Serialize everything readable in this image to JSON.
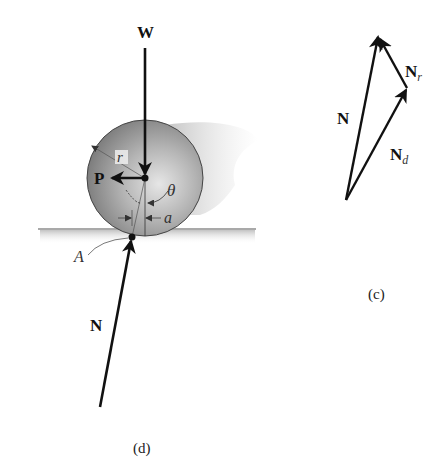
{
  "figure_d": {
    "caption": "(d)",
    "labels": {
      "weight": "W",
      "push_force": "P",
      "radius": "r",
      "angle": "θ",
      "offset": "a",
      "contact_point": "A",
      "normal": "N"
    },
    "colors": {
      "wheel_light": "#c8c8c8",
      "wheel_dark": "#7a7a7a",
      "arrow": "#111111",
      "ground": "#555555",
      "shadow": "#cfcfcf"
    }
  },
  "figure_c": {
    "caption": "(c)",
    "labels": {
      "resultant": "N",
      "resultant_r": "N",
      "resultant_r_sub": "r",
      "resultant_d": "N",
      "resultant_d_sub": "d"
    }
  }
}
